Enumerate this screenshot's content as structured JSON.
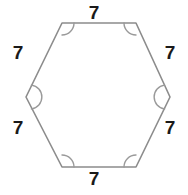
{
  "figure": {
    "shape_name": "hexagon",
    "background_color": "#ffffff",
    "outline_color": "#8c8c8c",
    "arc_color": "#9a9a9a",
    "label_color": "#1a1a1a",
    "stroke_width": 1.6,
    "arc_count": 6,
    "vertices": [
      {
        "name": "top-left",
        "x": 62,
        "y": 23
      },
      {
        "name": "top-right",
        "x": 136,
        "y": 23
      },
      {
        "name": "right",
        "x": 170,
        "y": 97
      },
      {
        "name": "bottom-right",
        "x": 136,
        "y": 167
      },
      {
        "name": "bottom-left",
        "x": 62,
        "y": 167
      },
      {
        "name": "left",
        "x": 26,
        "y": 97
      }
    ],
    "side_labels": {
      "top": "7",
      "upper_right": "7",
      "lower_right": "7",
      "bottom": "7",
      "lower_left": "7",
      "upper_left": "7"
    }
  }
}
